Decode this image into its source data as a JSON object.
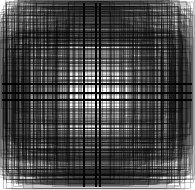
{
  "image": {
    "width": 195,
    "height": 190,
    "background": "#ffffff",
    "stroke": "#000000",
    "description": "Abstract pattern of overlapping thin rectangles centered on the image, densest in the middle"
  },
  "pattern": {
    "center_x": 96,
    "center_y": 93,
    "rect_count": 420,
    "max_half_width": 95,
    "max_half_height": 93,
    "stroke_width": 0.5,
    "stroke_opacity": 0.45,
    "seed": 12345,
    "dark_bands": {
      "vertical_x": [
        84,
        96,
        100
      ],
      "horizontal_y": [
        84,
        93,
        100
      ]
    }
  }
}
